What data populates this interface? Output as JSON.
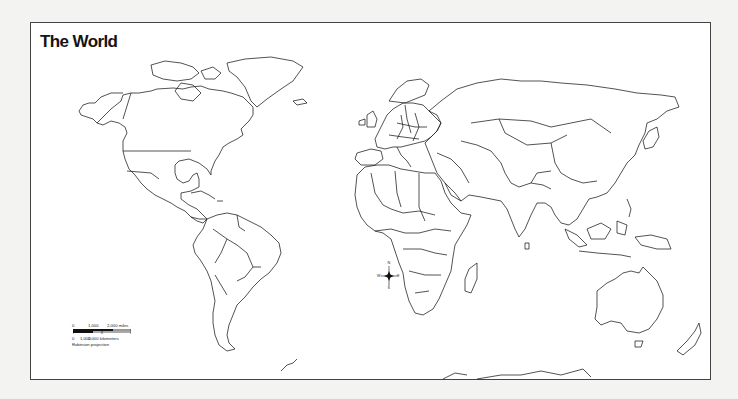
{
  "map": {
    "title": "The World",
    "projection": "Robinson projection",
    "scale_bar": {
      "miles": {
        "ticks": [
          "0",
          "1,000",
          "2,000 miles"
        ]
      },
      "kilometers": {
        "ticks": [
          "0",
          "1,000",
          "2,000 kilometers"
        ]
      }
    },
    "compass": {
      "n": "N",
      "s": "S",
      "e": "E",
      "w": "W"
    },
    "colors": {
      "background": "#f3f3f2",
      "frame_fill": "#ffffff",
      "outline": "#1a1a1a"
    }
  }
}
